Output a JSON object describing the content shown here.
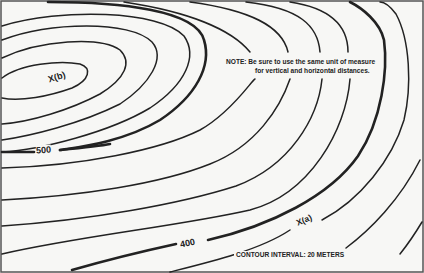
{
  "map": {
    "type": "topographic contour map",
    "contour_interval_text": "CONTOUR INTERVAL:  20 METERS",
    "note": {
      "line1": "NOTE:  Be sure to use the same unit of measure",
      "line2": "for vertical and horizontal distances."
    },
    "points": [
      {
        "id": "b",
        "label": "X(b)"
      },
      {
        "id": "a",
        "label": "X(a)"
      }
    ],
    "index_contours": [
      {
        "label": "500"
      },
      {
        "label": "400"
      }
    ],
    "colors": {
      "line": "#222222",
      "background": "#f7f7f5",
      "border": "#555555"
    }
  }
}
